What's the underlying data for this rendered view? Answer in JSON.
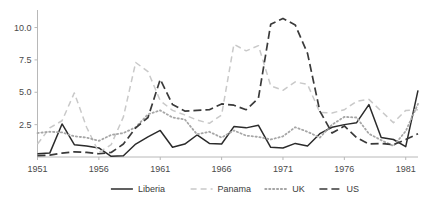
{
  "chart_data": {
    "type": "line",
    "title": "",
    "subtitle": "",
    "xlabel": "",
    "ylabel": "",
    "xlim": [
      1951,
      1982
    ],
    "ylim": [
      0,
      11.2
    ],
    "grid": false,
    "legend_position": "bottom",
    "xticks": [
      "1951",
      "1956",
      "1961",
      "1966",
      "1971",
      "1976",
      "1981"
    ],
    "xtick_values": [
      1951,
      1956,
      1961,
      1966,
      1971,
      1976,
      1981
    ],
    "yticks": [
      "2.5",
      "5.0",
      "7.5",
      "10.0"
    ],
    "ytick_values": [
      2.5,
      5.0,
      7.5,
      10.0
    ],
    "x": [
      1951,
      1952,
      1953,
      1954,
      1955,
      1956,
      1957,
      1958,
      1959,
      1960,
      1961,
      1962,
      1963,
      1964,
      1965,
      1966,
      1967,
      1968,
      1969,
      1970,
      1971,
      1972,
      1973,
      1974,
      1975,
      1976,
      1977,
      1978,
      1979,
      1980,
      1981,
      1982
    ],
    "series": [
      {
        "name": "Liberia",
        "color": "#2b2b2b",
        "dash": "solid",
        "values": [
          0.25,
          0.3,
          2.55,
          0.95,
          0.85,
          0.7,
          0.05,
          0.1,
          1.0,
          1.55,
          2.05,
          0.75,
          1.0,
          1.7,
          1.05,
          1.0,
          2.35,
          2.25,
          2.45,
          0.75,
          0.7,
          1.05,
          0.85,
          1.8,
          2.3,
          2.5,
          2.65,
          4.05,
          1.5,
          1.35,
          0.8,
          5.15
        ]
      },
      {
        "name": "Panama",
        "color": "#c9c9c9",
        "dash": "dashed",
        "values": [
          1.0,
          2.25,
          2.8,
          4.95,
          2.3,
          0.35,
          0.95,
          3.1,
          7.3,
          6.6,
          4.35,
          3.6,
          3.25,
          2.85,
          2.6,
          3.25,
          8.7,
          8.2,
          8.6,
          5.5,
          5.15,
          5.8,
          5.6,
          3.45,
          3.4,
          3.65,
          4.3,
          4.45,
          3.55,
          2.65,
          3.6,
          3.65
        ]
      },
      {
        "name": "UK",
        "color": "#a6a6a6",
        "dash": "dotted",
        "values": [
          1.85,
          1.95,
          1.9,
          1.6,
          1.5,
          1.25,
          1.7,
          1.85,
          2.3,
          3.3,
          3.6,
          3.05,
          2.9,
          1.75,
          1.95,
          1.5,
          2.05,
          1.65,
          1.55,
          1.35,
          1.6,
          2.3,
          1.95,
          1.5,
          2.5,
          3.1,
          3.05,
          1.8,
          1.3,
          0.85,
          2.0,
          4.1
        ]
      },
      {
        "name": "US",
        "color": "#3a3a3a",
        "dash": "dash-long",
        "values": [
          0.1,
          0.15,
          0.3,
          0.4,
          0.35,
          0.25,
          0.35,
          1.0,
          2.25,
          3.05,
          6.0,
          4.05,
          3.55,
          3.6,
          3.65,
          4.1,
          4.0,
          3.65,
          4.55,
          10.25,
          10.7,
          10.2,
          8.0,
          3.55,
          1.85,
          2.4,
          1.5,
          1.0,
          1.05,
          0.95,
          1.35,
          1.8
        ]
      }
    ],
    "legend": [
      {
        "label": "Liberia",
        "color": "#2b2b2b",
        "dash": "solid"
      },
      {
        "label": "Panama",
        "color": "#c9c9c9",
        "dash": "dashed"
      },
      {
        "label": "UK",
        "color": "#a6a6a6",
        "dash": "dotted"
      },
      {
        "label": "US",
        "color": "#3a3a3a",
        "dash": "dash-long"
      }
    ]
  },
  "axes": {
    "axis_color": "#b8b8b8",
    "tick_label_color": "#4a4a4a"
  }
}
